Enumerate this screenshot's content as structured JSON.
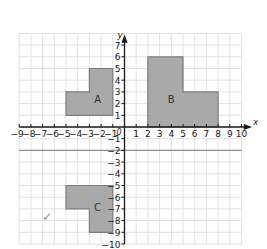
{
  "diagram": {
    "type": "coordinate-grid",
    "axes": {
      "x_label": "x",
      "y_label": "y",
      "origin_label": "0",
      "x_range": [
        -9,
        10
      ],
      "y_range": [
        -10,
        7
      ],
      "grid_x_range": [
        -9,
        10
      ],
      "grid_y_range": [
        -10,
        8
      ],
      "x_ticks": [
        "-9",
        "-8",
        "-7",
        "-6",
        "-5",
        "-4",
        "-3",
        "-2",
        "-1",
        "1",
        "2",
        "3",
        "4",
        "5",
        "6",
        "7",
        "8",
        "9",
        "10"
      ],
      "y_ticks": [
        "7",
        "6",
        "5",
        "4",
        "3",
        "2",
        "1",
        "-1",
        "-2",
        "-3",
        "-4",
        "-5",
        "-6",
        "-7",
        "-8",
        "-9",
        "-10"
      ]
    },
    "reference_line": {
      "name": "y = -2",
      "y": -2,
      "x_from": -9,
      "x_to": 10,
      "color": "#8a8f8a"
    },
    "shapes": [
      {
        "label": "A",
        "points": [
          [
            -5,
            1
          ],
          [
            -1,
            1
          ],
          [
            -1,
            5
          ],
          [
            -3,
            5
          ],
          [
            -3,
            3
          ],
          [
            -5,
            3
          ]
        ],
        "label_pos": [
          -2.3,
          2.4
        ]
      },
      {
        "label": "B",
        "points": [
          [
            2,
            0
          ],
          [
            8,
            0
          ],
          [
            8,
            3
          ],
          [
            5,
            3
          ],
          [
            5,
            6
          ],
          [
            2,
            6
          ]
        ],
        "label_pos": [
          4,
          2.4
        ]
      },
      {
        "label": "C",
        "points": [
          [
            -5,
            -5
          ],
          [
            -1,
            -5
          ],
          [
            -1,
            -9
          ],
          [
            -3,
            -9
          ],
          [
            -3,
            -7
          ],
          [
            -5,
            -7
          ]
        ],
        "label_pos": [
          -2.3,
          -6.8
        ]
      }
    ],
    "tick_mark": "✓",
    "colors": {
      "shape_fill": "#a9a9a9",
      "shape_stroke": "#7d7d7d",
      "grid": "#e2e2e2",
      "axis": "#1a1a1a",
      "text": "#1a1a1a"
    }
  }
}
